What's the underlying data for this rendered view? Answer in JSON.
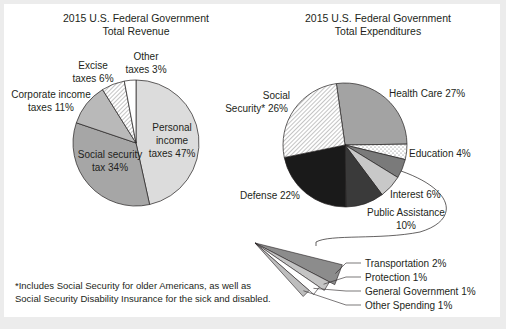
{
  "chart_data": [
    {
      "type": "pie",
      "title": [
        "2015 U.S. Federal Government",
        "Total Revenue"
      ],
      "slices": [
        {
          "name": "Personal income taxes",
          "value": 47,
          "label": [
            "Personal",
            "income",
            "taxes 47%"
          ],
          "fill": "#dcdcdc",
          "pattern": "solid"
        },
        {
          "name": "Social security tax",
          "value": 34,
          "label": [
            "Social security",
            "tax 34%"
          ],
          "fill": "#a6a6a6",
          "pattern": "solid"
        },
        {
          "name": "Corporate income taxes",
          "value": 11,
          "label": [
            "Corporate income",
            "taxes 11%"
          ],
          "fill": "#b9b9b9",
          "pattern": "solid"
        },
        {
          "name": "Excise taxes",
          "value": 6,
          "label": [
            "Excise",
            "taxes 6%"
          ],
          "fill": "#ffffff",
          "pattern": "hatch"
        },
        {
          "name": "Other taxes",
          "value": 3,
          "label": [
            "Other",
            "taxes 3%"
          ],
          "fill": "#ffffff",
          "pattern": "solid"
        }
      ]
    },
    {
      "type": "pie",
      "title": [
        "2015 U.S. Federal Government",
        "Total Expenditures"
      ],
      "slices": [
        {
          "name": "Health Care",
          "value": 27,
          "label": [
            "Health Care 27%"
          ],
          "fill": "#a3a3a3",
          "pattern": "solid"
        },
        {
          "name": "Education",
          "value": 4,
          "label": [
            "Education 4%"
          ],
          "fill": "#ffffff",
          "pattern": "dots"
        },
        {
          "name": "Other (detail below)",
          "value": 5,
          "label": [],
          "fill": "#7a7a7a",
          "pattern": "solid"
        },
        {
          "name": "Interest",
          "value": 6,
          "label": [
            "Interest 6%"
          ],
          "fill": "#c8c8c8",
          "pattern": "solid"
        },
        {
          "name": "Public Assistance",
          "value": 10,
          "label": [
            "Public Assistance",
            "10%"
          ],
          "fill": "#3a3a3a",
          "pattern": "solid"
        },
        {
          "name": "Defense",
          "value": 22,
          "label": [
            "Defense 22%"
          ],
          "fill": "#1a1a1a",
          "pattern": "solid"
        },
        {
          "name": "Social Security",
          "value": 26,
          "label": [
            "Social",
            "Security* 26%"
          ],
          "fill": "#ffffff",
          "pattern": "hatch"
        }
      ],
      "breakout": [
        {
          "name": "Transportation",
          "value": 2,
          "label": "Transportation 2%",
          "fill": "#8c8c8c"
        },
        {
          "name": "Protection",
          "value": 1,
          "label": "Protection 1%",
          "fill": "#c4c4c4"
        },
        {
          "name": "General Government",
          "value": 1,
          "label": "General Government 1%",
          "fill": "#ffffff"
        },
        {
          "name": "Other Spending",
          "value": 1,
          "label": "Other Spending 1%",
          "fill": "#bdbdbd"
        }
      ]
    }
  ],
  "footnote": [
    "*Includes Social Security for older Americans, as well as",
    " Social Security Disability Insurance for the sick and disabled."
  ]
}
